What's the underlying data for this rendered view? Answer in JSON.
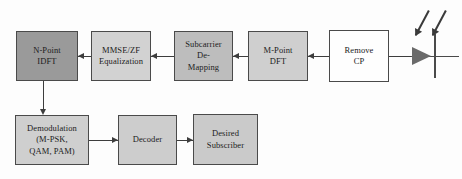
{
  "diagram": {
    "background_color": "#fdfdfd",
    "line_color": "#3d3d3d",
    "text_color": "#1c1c1c"
  },
  "blocks": [
    {
      "id": "n-point-idft",
      "label": "N-Point\nIDFT",
      "fill": "#9a9a9a",
      "x": 16,
      "y": 31,
      "w": 62,
      "h": 50
    },
    {
      "id": "mmse-zf-equalization",
      "label": "MMSE/ZF\nEqualization",
      "fill": "#d2d2d2",
      "x": 91,
      "y": 31,
      "w": 60,
      "h": 50
    },
    {
      "id": "subcarrier-de-mapping",
      "label": "Subcarrier\nDe-\nMapping",
      "fill": "#bdbdbd",
      "x": 174,
      "y": 31,
      "w": 59,
      "h": 50
    },
    {
      "id": "m-point-dft",
      "label": "M-Point\nDFT",
      "fill": "#cfcfcf",
      "x": 248,
      "y": 31,
      "w": 60,
      "h": 50
    },
    {
      "id": "remove-cp",
      "label": "Remove\nCP",
      "fill": "#fefefe",
      "x": 329,
      "y": 30,
      "w": 60,
      "h": 52
    },
    {
      "id": "demodulation",
      "label": "Demodulation\n(M-PSK,\nQAM, PAM)",
      "fill": "#cfcfcf",
      "x": 15,
      "y": 115,
      "w": 74,
      "h": 50
    },
    {
      "id": "decoder",
      "label": "Decoder",
      "fill": "#cdcdcd",
      "x": 118,
      "y": 115,
      "w": 59,
      "h": 50
    },
    {
      "id": "desired-subscriber",
      "label": "Desired\nSubscriber",
      "fill": "#cacaca",
      "x": 193,
      "y": 114,
      "w": 65,
      "h": 51
    }
  ],
  "connectors": [
    {
      "id": "conn-equalization-to-idft",
      "direction": "left"
    },
    {
      "id": "conn-demapping-to-equalization",
      "direction": "left"
    },
    {
      "id": "conn-dft-to-demapping",
      "direction": "left"
    },
    {
      "id": "conn-removecp-to-dft",
      "direction": "left"
    },
    {
      "id": "conn-antenna-to-removecp",
      "direction": "left"
    },
    {
      "id": "conn-idft-to-demodulation",
      "direction": "down"
    },
    {
      "id": "conn-demodulation-to-decoder",
      "direction": "right"
    },
    {
      "id": "conn-decoder-to-subscriber",
      "direction": "right"
    }
  ],
  "antenna": {
    "id": "receive-antenna",
    "symbol": "antenna-triangle",
    "incoming_waves": 2
  }
}
